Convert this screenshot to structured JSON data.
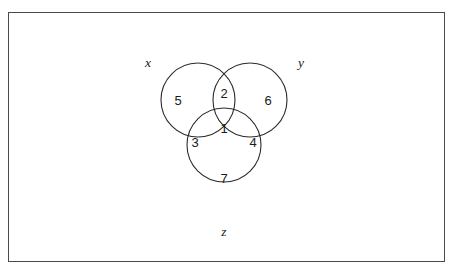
{
  "diagram": {
    "type": "venn-3-set",
    "title": "",
    "background_color": "#ffffff",
    "stroke_color": "#2b2b2b",
    "frame_color": "#4a4a4a",
    "text_color": "#1a1a1a",
    "sets": [
      {
        "id": "x",
        "label": "x",
        "cx": 198,
        "cy": 100,
        "r": 37,
        "label_x": 148,
        "label_y": 62
      },
      {
        "id": "y",
        "label": "y",
        "cx": 250,
        "cy": 100,
        "r": 37,
        "label_x": 301,
        "label_y": 62
      },
      {
        "id": "z",
        "label": "z",
        "cx": 224,
        "cy": 145,
        "r": 37,
        "label_x": 224,
        "label_y": 231
      }
    ],
    "regions": [
      {
        "id": "x-only",
        "value": "5",
        "x": 178,
        "y": 100
      },
      {
        "id": "x-and-y",
        "value": "2",
        "x": 224,
        "y": 93
      },
      {
        "id": "y-only",
        "value": "6",
        "x": 268,
        "y": 100
      },
      {
        "id": "x-and-z",
        "value": "3",
        "x": 195,
        "y": 142
      },
      {
        "id": "all-three",
        "value": "1",
        "x": 224,
        "y": 128
      },
      {
        "id": "y-and-z",
        "value": "4",
        "x": 253,
        "y": 142
      },
      {
        "id": "z-only",
        "value": "7",
        "x": 224,
        "y": 178
      }
    ]
  }
}
